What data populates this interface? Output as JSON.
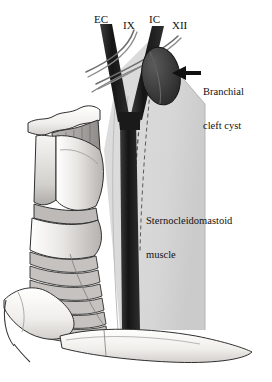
{
  "figure": {
    "type": "anatomical-illustration",
    "width": 272,
    "height": 382,
    "background_color": "#ffffff"
  },
  "palette": {
    "background": "#ffffff",
    "neck_shading": "#d8d8d8",
    "neck_shading_dark": "#c9c9c9",
    "vessel_dark": "#1a1a1a",
    "cyst_fill": "#3a3a3a",
    "cartilage_light": "#f0efed",
    "cartilage_mid": "#c2c0bd",
    "cartilage_dark": "#9b9896",
    "outline": "#2b2b2b",
    "nerve_line": "#7a7a7a",
    "text": "#111111"
  },
  "labels": {
    "external_carotid": "EC",
    "glossopharyngeal_nerve": "IX",
    "internal_carotid": "IC",
    "hypoglossal_nerve": "XII"
  },
  "annotations": {
    "cyst": {
      "line1": "Branchial",
      "line2": "cleft cyst",
      "arrow_direction": "left",
      "arrow_color": "#111111"
    },
    "muscle": {
      "line1": "Sternocleidomastoid",
      "line2": "muscle"
    }
  },
  "structures": [
    {
      "name": "hyoid-bone",
      "shade": "light"
    },
    {
      "name": "thyrohyoid-membrane",
      "shade": "mid"
    },
    {
      "name": "thyroid-cartilage",
      "shade": "light"
    },
    {
      "name": "cricothyroid-membrane",
      "shade": "mid"
    },
    {
      "name": "cricoid-cartilage",
      "shade": "light"
    },
    {
      "name": "tracheal-rings",
      "shade": "mid"
    },
    {
      "name": "clavicle",
      "shade": "light"
    },
    {
      "name": "manubrium",
      "shade": "light"
    },
    {
      "name": "common-carotid-artery",
      "shade": "dark"
    },
    {
      "name": "external-carotid-artery",
      "shade": "dark"
    },
    {
      "name": "internal-carotid-artery",
      "shade": "dark"
    },
    {
      "name": "branchial-cleft-cyst",
      "shade": "dark"
    },
    {
      "name": "sternocleidomastoid-muscle",
      "shade": "shaded"
    }
  ],
  "icons": {
    "arrow": "left-arrow-icon"
  }
}
